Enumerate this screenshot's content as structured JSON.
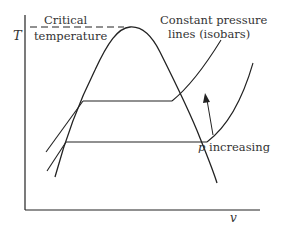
{
  "diagram": {
    "type": "T-v phase diagram",
    "axes": {
      "y_label": "T",
      "x_label": "v"
    },
    "labels": {
      "critical_line1": "Critical",
      "critical_line2": "temperature",
      "isobar_line1": "Constant pressure",
      "isobar_line2": "lines (isobars)",
      "p_symbol": "p",
      "p_increasing": " increasing"
    },
    "colors": {
      "line": "#222222",
      "text": "#333333",
      "background": "#ffffff"
    }
  }
}
